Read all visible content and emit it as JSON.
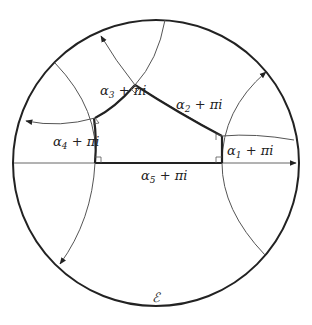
{
  "diagram": {
    "type": "hyperbolic-right-angled-pentagon",
    "boundary_label": "ℰ",
    "colors": {
      "boundary": "#222222",
      "thin_line": "#555555",
      "thick_line": "#222222",
      "background": "#ffffff"
    },
    "labels": {
      "alpha1": {
        "greek": "α",
        "sub": "1",
        "rest": " + πi"
      },
      "alpha2": {
        "greek": "α",
        "sub": "2",
        "rest": " + πi"
      },
      "alpha3": {
        "greek": "α",
        "sub": "3",
        "rest": " + πi"
      },
      "alpha4": {
        "greek": "α",
        "sub": "4",
        "rest": " + πi"
      },
      "alpha5": {
        "greek": "α",
        "sub": "5",
        "rest": " + πi"
      }
    },
    "right_angle_markers": 5
  }
}
